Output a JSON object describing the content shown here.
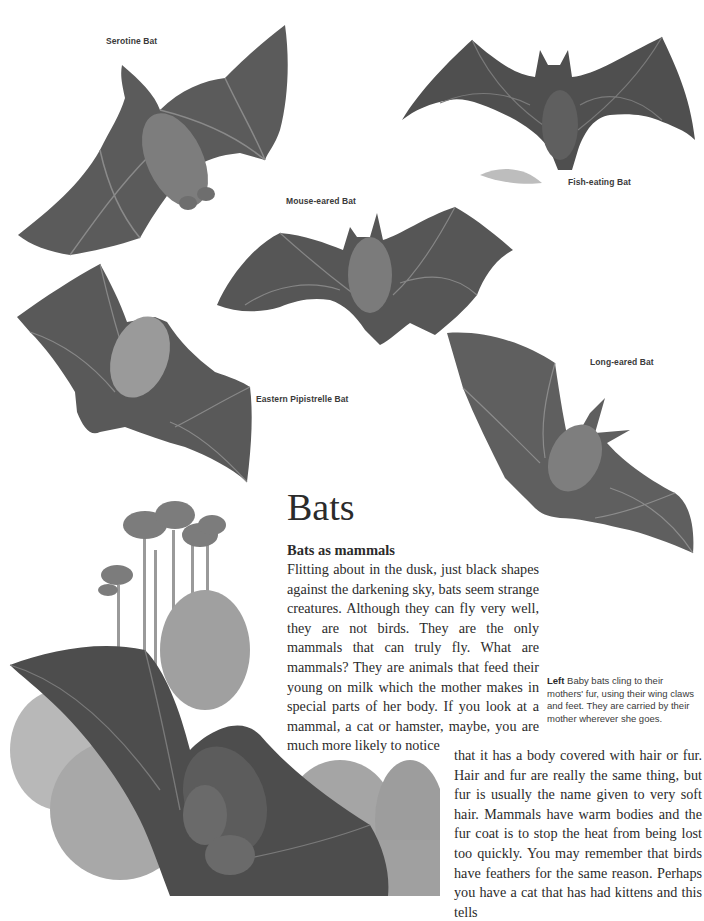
{
  "page": {
    "title": "Bats",
    "section_heading": "Bats as mammals",
    "body_paragraph_part1": "Flitting about in the dusk, just black shapes against the darkening sky, bats seem strange creatures. Although they can fly very well, they are not birds. They are the only mammals that can truly fly. What are mammals? They are animals that feed their young on milk which the mother makes in special parts of her body. If you look at a mammal, a cat or hamster, maybe, you are much more likely to notice",
    "body_paragraph_part2": "that it has a body covered with hair or fur. Hair and fur are really the same thing, but fur is usually the name given to very soft hair. Mammals have warm bodies and the fur coat is to stop the heat from being lost too quickly. You may remember that birds have feathers for the same reason. Perhaps you have a cat that has had kittens and this tells"
  },
  "illustration_labels": {
    "serotine": "Serotine Bat",
    "fish_eating": "Fish-eating Bat",
    "mouse_eared": "Mouse-eared Bat",
    "eastern_pipistrelle": "Eastern Pipistrelle Bat",
    "long_eared": "Long-eared Bat"
  },
  "side_caption": {
    "lead": "Left",
    "text": " Baby bats cling to their mothers' fur, using their wing claws and feet. They are carried by their mother wherever she goes."
  },
  "colors": {
    "wing": "#5a5a5a",
    "wing_dark": "#454545",
    "body": "#7a7a7a",
    "tree": "#8a8a8a",
    "text": "#2b2b2b"
  }
}
